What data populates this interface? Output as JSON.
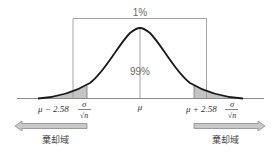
{
  "diagram": {
    "top_label": "1%",
    "center_label": "99%",
    "mean_label": "μ",
    "left_bound": {
      "prefix": "μ − 2.58",
      "numerator": "σ",
      "denominator": "√n"
    },
    "right_bound": {
      "prefix": "μ + 2.58",
      "numerator": "σ",
      "denominator": "√n"
    },
    "left_region_label": "棄却域",
    "right_region_label": "棄却域",
    "colors": {
      "curve": "#1a1a1a",
      "shade": "#c4c4c4",
      "axis": "#8a8a8a",
      "box": "#9a9a9a",
      "arrow_fill": "#c8c8c8",
      "arrow_stroke": "#8c8c8c"
    }
  }
}
